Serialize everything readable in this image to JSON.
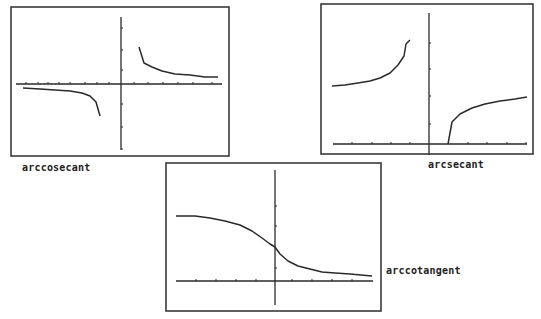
{
  "chart_data": [
    {
      "type": "line",
      "title": "arccosecant",
      "frame": {
        "x": 11,
        "y": 7,
        "w": 218,
        "h": 149
      },
      "axes": {
        "x_axis_y": 84,
        "x_from": 16,
        "x_to": 222,
        "y_axis_x": 121,
        "y_from": 17,
        "y_to": 150,
        "x_ticks": [
          26,
          38,
          48,
          59,
          70,
          85,
          97,
          109,
          134,
          148,
          163,
          178,
          193,
          212
        ],
        "y_ticks": [
          28,
          50,
          70,
          104,
          127,
          149
        ]
      },
      "series": [
        {
          "name": "left branch",
          "points": [
            [
              23,
              88
            ],
            [
              40,
              89
            ],
            [
              55,
              90
            ],
            [
              70,
              91
            ],
            [
              82,
              93
            ],
            [
              90,
              96
            ],
            [
              96,
              102
            ],
            [
              100,
              116
            ]
          ]
        },
        {
          "name": "right branch",
          "points": [
            [
              139,
              47
            ],
            [
              144,
              63
            ],
            [
              152,
              67
            ],
            [
              162,
              71
            ],
            [
              175,
              74
            ],
            [
              190,
              75
            ],
            [
              205,
              77
            ],
            [
              218,
              77
            ]
          ]
        }
      ],
      "label": {
        "text": "arccosecant",
        "x": 22,
        "y": 162
      }
    },
    {
      "type": "line",
      "title": "arcsecant",
      "frame": {
        "x": 321,
        "y": 4,
        "w": 212,
        "h": 150
      },
      "axes": {
        "x_axis_y": 144,
        "x_from": 333,
        "x_to": 527,
        "y_axis_x": 429,
        "y_from": 13,
        "y_to": 155,
        "x_ticks": [
          352,
          372,
          391,
          410,
          468,
          487,
          507,
          526
        ],
        "y_ticks": [
          43,
          69,
          96,
          124
        ]
      },
      "series": [
        {
          "name": "left branch",
          "points": [
            [
              332,
              86
            ],
            [
              345,
              85
            ],
            [
              358,
              83
            ],
            [
              370,
              81
            ],
            [
              380,
              78
            ],
            [
              390,
              73
            ],
            [
              398,
              65
            ],
            [
              404,
              56
            ],
            [
              406,
              44
            ],
            [
              410,
              40
            ]
          ]
        },
        {
          "name": "right branch",
          "points": [
            [
              448,
              144
            ],
            [
              452,
              122
            ],
            [
              460,
              114
            ],
            [
              472,
              108
            ],
            [
              485,
              104
            ],
            [
              500,
              101
            ],
            [
              515,
              99
            ],
            [
              527,
              97
            ]
          ]
        }
      ],
      "label": {
        "text": "arcsecant",
        "x": 428,
        "y": 159
      }
    },
    {
      "type": "line",
      "title": "arccotangent",
      "frame": {
        "x": 166,
        "y": 163,
        "w": 215,
        "h": 148
      },
      "axes": {
        "x_axis_y": 281,
        "x_from": 176,
        "x_to": 373,
        "y_axis_x": 275,
        "y_from": 170,
        "y_to": 305,
        "x_ticks": [
          196,
          216,
          236,
          256,
          292,
          312,
          332,
          352
        ],
        "y_ticks": [
          206,
          226,
          268
        ]
      },
      "series": [
        {
          "name": "arccot",
          "points": [
            [
              176,
              216
            ],
            [
              195,
              216
            ],
            [
              210,
              218
            ],
            [
              225,
              221
            ],
            [
              240,
              225
            ],
            [
              252,
              231
            ],
            [
              262,
              238
            ],
            [
              270,
              244
            ],
            [
              275,
              247
            ],
            [
              280,
              254
            ],
            [
              288,
              261
            ],
            [
              298,
              266
            ],
            [
              310,
              269
            ],
            [
              322,
              272
            ],
            [
              335,
              273
            ],
            [
              350,
              274
            ],
            [
              372,
              276
            ]
          ]
        }
      ],
      "label": {
        "text": "arccotangent",
        "x": 386,
        "y": 265
      }
    }
  ],
  "labels": {
    "g1": "arccosecant",
    "g2": "arcsecant",
    "g3": "arccotangent"
  },
  "colors": {
    "ink": "#2a2a2a",
    "frame": "#3a3a3a",
    "background": "#ffffff"
  }
}
